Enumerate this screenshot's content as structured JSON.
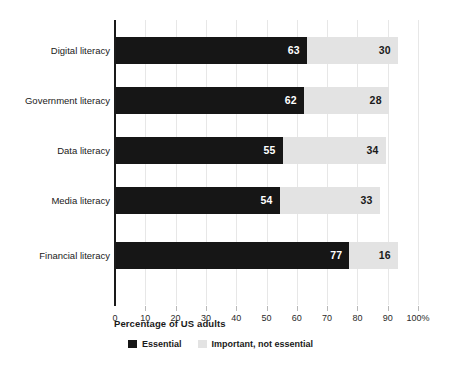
{
  "chart_data": {
    "type": "bar",
    "orientation": "horizontal",
    "stacked": true,
    "title": "",
    "xlabel": "Percentage of US adults",
    "ylabel": "",
    "xlim": [
      0,
      100
    ],
    "xticks": [
      0,
      10,
      20,
      30,
      40,
      50,
      60,
      70,
      80,
      90,
      100
    ],
    "xtick_labels": [
      "0",
      "10",
      "20",
      "30",
      "40",
      "50",
      "60",
      "70",
      "80",
      "90",
      "100%"
    ],
    "grid": "vertical",
    "legend_position": "bottom",
    "categories": [
      "Digital literacy",
      "Government literacy",
      "Data literacy",
      "Media literacy",
      "Financial literacy"
    ],
    "series": [
      {
        "name": "Essential",
        "color": "#161616",
        "values": [
          63,
          62,
          55,
          54,
          77
        ]
      },
      {
        "name": "Important, not essential",
        "color": "#e3e3e3",
        "values": [
          30,
          28,
          34,
          33,
          16
        ]
      }
    ]
  },
  "axis": {
    "title": "Percentage of US adults"
  },
  "legend": {
    "items": [
      {
        "label": "Essential",
        "color": "#161616"
      },
      {
        "label": "Important, not essential",
        "color": "#e3e3e3"
      }
    ]
  },
  "colors": {
    "essential": "#161616",
    "important": "#e3e3e3",
    "gridline": "#e7e7e7",
    "axis": "#161616",
    "background": "#ffffff"
  }
}
